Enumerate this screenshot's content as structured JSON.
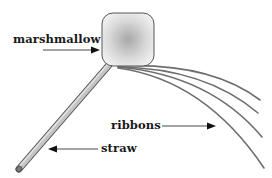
{
  "labels": {
    "marshmallow": "marshmallow",
    "ribbons": "ribbons",
    "straw": "straw"
  },
  "colors": {
    "outline": "#555555",
    "straw_fill": "#bdbdbd",
    "ribbon": "#6a6a6a",
    "text": "#1a1a1a"
  }
}
